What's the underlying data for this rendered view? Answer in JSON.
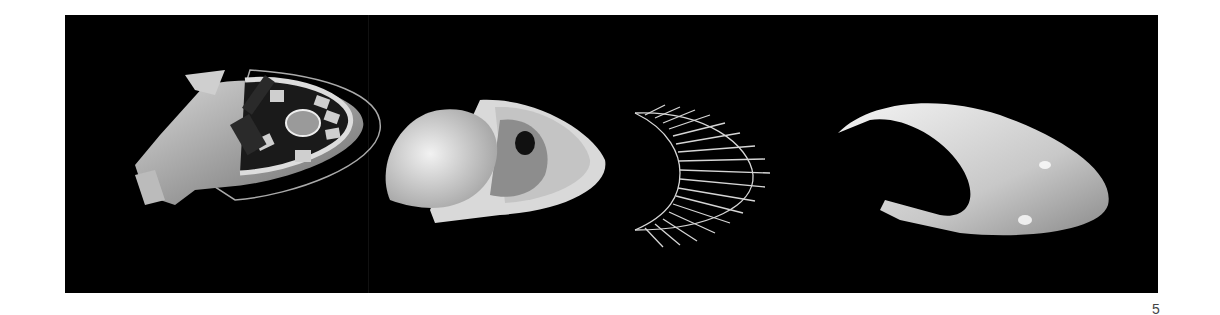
{
  "page": {
    "page_number": "5",
    "background": "#ffffff",
    "panel_color": "#000000"
  },
  "figures": [
    {
      "name": "stadium-plan-render",
      "description": "3D model of building complex with oval ring and central stadium"
    },
    {
      "name": "shell-cutaway-render",
      "description": "white shell model with dome and inner cavity"
    },
    {
      "name": "structural-ribs-render",
      "description": "wireframe of radial ribs along crescent arc"
    },
    {
      "name": "crescent-shell-render",
      "description": "smooth white crescent shell surface"
    }
  ]
}
